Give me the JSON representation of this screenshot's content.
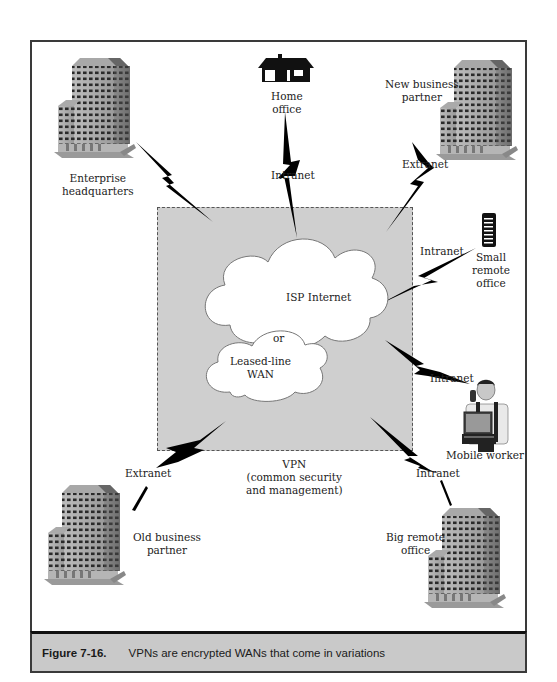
{
  "figure": {
    "number": "Figure 7-16.",
    "caption": "VPNs are encrypted WANs that come in variations"
  },
  "vpn": {
    "label_line1": "VPN",
    "label_line2": "(common security",
    "label_line3": "and management)"
  },
  "clouds": {
    "primary": "ISP Internet",
    "connector": "or",
    "secondary_line1": "Leased-line",
    "secondary_line2": "WAN"
  },
  "nodes": {
    "enterprise_hq": {
      "line1": "Enterprise",
      "line2": "headquarters",
      "icon": "office-building"
    },
    "home_office": {
      "line1": "Home",
      "line2": "office",
      "icon": "house",
      "link": "Intranet"
    },
    "new_partner": {
      "line1": "New business",
      "line2": "partner",
      "icon": "office-building",
      "link": "Extranet"
    },
    "small_remote": {
      "line1": "Small",
      "line2": "remote",
      "line3": "office",
      "icon": "server",
      "link": "Intranet"
    },
    "mobile_worker": {
      "line1": "Mobile worker",
      "icon": "person-laptop",
      "link": "Intranet"
    },
    "old_partner": {
      "line1": "Old business",
      "line2": "partner",
      "icon": "office-building",
      "link": "Extranet"
    },
    "big_remote": {
      "line1": "Big remote",
      "line2": "office",
      "icon": "office-building",
      "link": "Intranet"
    }
  },
  "colors": {
    "frame": "#3a3a3a",
    "vpn_fill": "#cfcfcf",
    "caption_bar": "#c9c9c9",
    "bolt": "#000000",
    "cloud": "#ffffff"
  }
}
